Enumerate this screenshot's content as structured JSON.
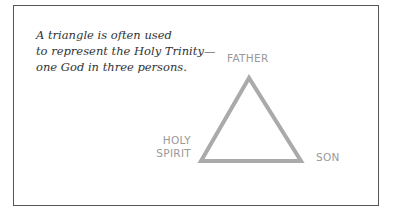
{
  "caption": {
    "line1": "A triangle is often used",
    "line2": "to represent the Holy Trinity—",
    "line3": "one God in three persons."
  },
  "diagram": {
    "shape": "triangle",
    "stroke_color": "#aaaaaa",
    "labels": {
      "top": "FATHER",
      "left_line1": "HOLY",
      "left_line2": "SPIRIT",
      "right": "SON"
    }
  }
}
